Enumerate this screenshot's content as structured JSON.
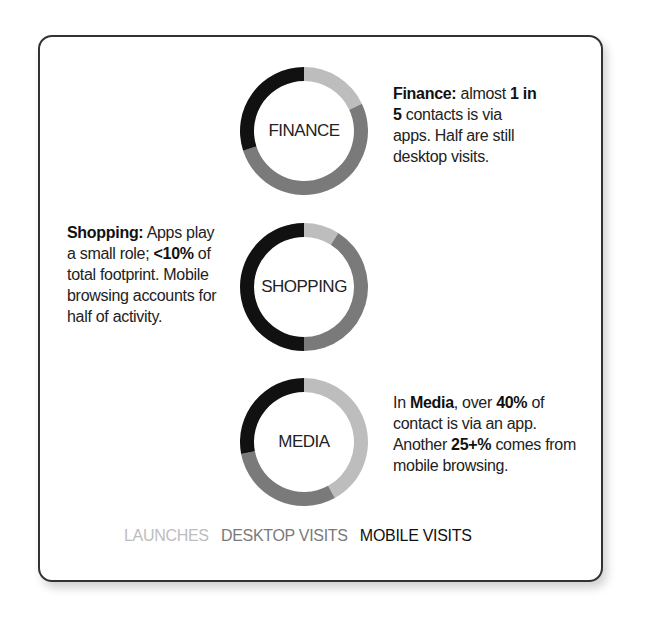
{
  "chart_data": {
    "type": "pie",
    "subtype": "donut",
    "title": "",
    "legend": {
      "position": "bottom",
      "entries": [
        {
          "name": "LAUNCHES",
          "color": "#bdbdbd"
        },
        {
          "name": "DESKTOP VISITS",
          "color": "#7a7a7a"
        },
        {
          "name": "MOBILE VISITS",
          "color": "#111111"
        }
      ]
    },
    "categories": [
      "LAUNCHES",
      "DESKTOP VISITS",
      "MOBILE VISITS"
    ],
    "series": [
      {
        "name": "FINANCE",
        "values": [
          18,
          52,
          30
        ]
      },
      {
        "name": "SHOPPING",
        "values": [
          9,
          41,
          50
        ]
      },
      {
        "name": "MEDIA",
        "values": [
          42,
          30,
          28
        ]
      }
    ],
    "annotations": [
      "Finance: almost 1 in 5 contacts is via apps. Half are still desktop visits.",
      "Shopping: Apps play a small role; <10% of total footprint. Mobile browsing accounts for half of activity.",
      "In Media, over 40% of contact is via an app. Another 25+% comes from mobile browsing."
    ]
  },
  "colors": {
    "launches": "#bdbdbd",
    "desktop": "#7a7a7a",
    "mobile": "#111111"
  },
  "donuts": {
    "finance": {
      "label": "FINANCE"
    },
    "shopping": {
      "label": "SHOPPING"
    },
    "media": {
      "label": "MEDIA"
    }
  },
  "notes": {
    "finance": {
      "b1": "Finance:",
      "t1": " almost ",
      "b2": "1 in 5",
      "t2": " contacts is via apps. Half are still desktop visits."
    },
    "shopping": {
      "b1": "Shopping:",
      "t1": " Apps play a small role; ",
      "b2": "<10%",
      "t2": " of total footprint. Mobile browsing accounts for half of activity."
    },
    "media": {
      "t0": "In ",
      "b1": "Media",
      "t1": ", over ",
      "b2": "40%",
      "t2": " of contact is via an app. Another ",
      "b3": "25+%",
      "t3": " comes from mobile browsing."
    }
  },
  "legend": {
    "launches": "LAUNCHES",
    "desktop": "DESKTOP VISITS",
    "mobile": "MOBILE VISITS"
  }
}
